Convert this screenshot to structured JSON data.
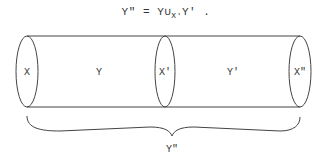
{
  "formula": {
    "lhs": "Y\"",
    "eq": "=",
    "a": "Y",
    "union": "∪",
    "sub": "X'",
    "b": "Y'",
    "end": "."
  },
  "labels": {
    "x": "X",
    "y": "Y",
    "x_prime": "X'",
    "y_prime": "Y'",
    "x_double_prime": "X\"",
    "brace": "Y\""
  }
}
